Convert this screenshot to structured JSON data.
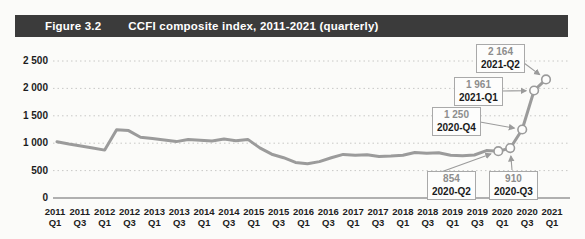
{
  "header": {
    "figure_label": "Figure 3.2",
    "title": "CCFI composite index, 2011-2021 (quarterly)"
  },
  "colors": {
    "header_bg": "#3b3b3b",
    "header_text": "#ffffff",
    "line": "#9b9b9b",
    "grid": "#c8c8c6",
    "axis": "#979797",
    "tick_text": "#1d1d1d",
    "annotation_value": "#8d8d8d",
    "annotation_date": "#1a1a1a",
    "box_border": "#a9a9a9",
    "box_bg": "#fdfdfc",
    "background": "#fbfbf9"
  },
  "chart_data": {
    "type": "line",
    "title": "CCFI composite index, 2011-2021 (quarterly)",
    "x": [
      "2011-Q1",
      "2011-Q2",
      "2011-Q3",
      "2011-Q4",
      "2012-Q1",
      "2012-Q2",
      "2012-Q3",
      "2012-Q4",
      "2013-Q1",
      "2013-Q2",
      "2013-Q3",
      "2013-Q4",
      "2014-Q1",
      "2014-Q2",
      "2014-Q3",
      "2014-Q4",
      "2015-Q1",
      "2015-Q2",
      "2015-Q3",
      "2015-Q4",
      "2016-Q1",
      "2016-Q2",
      "2016-Q3",
      "2016-Q4",
      "2017-Q1",
      "2017-Q2",
      "2017-Q3",
      "2017-Q4",
      "2018-Q1",
      "2018-Q2",
      "2018-Q3",
      "2018-Q4",
      "2019-Q1",
      "2019-Q2",
      "2019-Q3",
      "2019-Q4",
      "2020-Q1",
      "2020-Q2",
      "2020-Q3",
      "2020-Q4",
      "2021-Q1",
      "2021-Q2"
    ],
    "values": [
      1025,
      985,
      950,
      915,
      875,
      1245,
      1230,
      1110,
      1085,
      1060,
      1030,
      1070,
      1055,
      1040,
      1075,
      1045,
      1070,
      915,
      800,
      735,
      650,
      625,
      665,
      735,
      795,
      780,
      790,
      755,
      765,
      780,
      830,
      815,
      825,
      780,
      770,
      785,
      865,
      854,
      910,
      1250,
      1961,
      2164
    ],
    "ylim": [
      0,
      2500
    ],
    "y_ticks": [
      0,
      500,
      1000,
      1500,
      2000,
      2500
    ],
    "y_tick_labels": [
      "0",
      "500",
      "1 000",
      "1 500",
      "2 000",
      "2 500"
    ],
    "x_tick_labels": [
      {
        "year": "2011",
        "quarter": "Q1"
      },
      {
        "year": "2011",
        "quarter": "Q3"
      },
      {
        "year": "2012",
        "quarter": "Q1"
      },
      {
        "year": "2012",
        "quarter": "Q3"
      },
      {
        "year": "2013",
        "quarter": "Q1"
      },
      {
        "year": "2013",
        "quarter": "Q3"
      },
      {
        "year": "2014",
        "quarter": "Q1"
      },
      {
        "year": "2014",
        "quarter": "Q3"
      },
      {
        "year": "2015",
        "quarter": "Q1"
      },
      {
        "year": "2015",
        "quarter": "Q3"
      },
      {
        "year": "2016",
        "quarter": "Q1"
      },
      {
        "year": "2016",
        "quarter": "Q3"
      },
      {
        "year": "2017",
        "quarter": "Q1"
      },
      {
        "year": "2017",
        "quarter": "Q3"
      },
      {
        "year": "2018",
        "quarter": "Q1"
      },
      {
        "year": "2018",
        "quarter": "Q3"
      },
      {
        "year": "2019",
        "quarter": "Q1"
      },
      {
        "year": "2019",
        "quarter": "Q3"
      },
      {
        "year": "2020",
        "quarter": "Q1"
      },
      {
        "year": "2020",
        "quarter": "Q3"
      },
      {
        "year": "2021",
        "quarter": "Q1"
      }
    ],
    "grid": true,
    "legend": "none",
    "annotations": [
      {
        "value": "854",
        "date": "2020-Q2",
        "index": 37
      },
      {
        "value": "910",
        "date": "2020-Q3",
        "index": 38
      },
      {
        "value": "1 250",
        "date": "2020-Q4",
        "index": 39
      },
      {
        "value": "1 961",
        "date": "2021-Q1",
        "index": 40
      },
      {
        "value": "2 164",
        "date": "2021-Q2",
        "index": 41
      }
    ]
  }
}
